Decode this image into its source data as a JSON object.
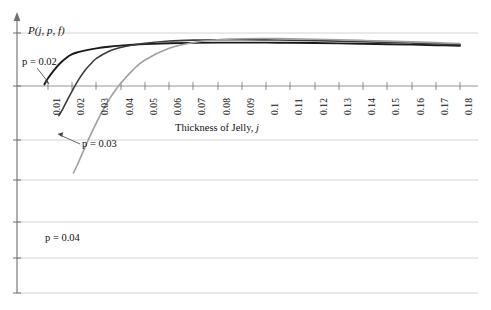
{
  "figure": {
    "name": "probability-vs-jelly-thickness-plot",
    "background": "#ffffff"
  },
  "chart_data": {
    "type": "line",
    "title": "",
    "xlabel": "Thickness of Jelly, j",
    "ylabel": "P(j, p, f)",
    "xlabel_plain": "Thickness of Jelly",
    "xlabel_variable": "j",
    "ylabel_text": "P(j, p, f)",
    "x_tick_labels": [
      "0.01",
      "0.02",
      "0.03",
      "0.04",
      "0.05",
      "0.06",
      "0.07",
      "0.08",
      "0.09",
      "0.1",
      "0.11",
      "0.12",
      "0.13",
      "0.14",
      "0.15",
      "0.16",
      "0.17",
      "0.18"
    ],
    "x_tick_values": [
      0.01,
      0.02,
      0.03,
      0.04,
      0.05,
      0.06,
      0.07,
      0.08,
      0.09,
      0.1,
      0.11,
      0.12,
      0.13,
      0.14,
      0.15,
      0.16,
      0.17,
      0.18
    ],
    "xlim": [
      0.005,
      0.185
    ],
    "y_tick_labels": [],
    "ylim_note": "unlabeled y axis; horizontal gridlines only",
    "grid": "horizontal",
    "grid_color": "#c8c8c8",
    "legend_position": "inline-annotations",
    "axis_color": "#555555",
    "series": [
      {
        "name": "p = 0.02",
        "label": "p = 0.02",
        "color": "#1a1a1a",
        "annotation_text": "p = 0.02",
        "x": [
          0.0085,
          0.01,
          0.0125,
          0.015,
          0.0175,
          0.02,
          0.0225,
          0.025,
          0.03,
          0.035,
          0.04,
          0.045,
          0.05,
          0.06,
          0.07,
          0.08,
          0.09,
          0.1,
          0.11,
          0.12,
          0.13,
          0.14,
          0.15,
          0.16,
          0.17,
          0.18
        ],
        "y": [
          0.03,
          0.145,
          0.3,
          0.43,
          0.53,
          0.6,
          0.64,
          0.668,
          0.71,
          0.74,
          0.762,
          0.778,
          0.79,
          0.806,
          0.814,
          0.818,
          0.819,
          0.818,
          0.815,
          0.81,
          0.804,
          0.797,
          0.789,
          0.78,
          0.77,
          0.76
        ]
      },
      {
        "name": "p = 0.03",
        "label": "p = 0.03",
        "color": "#3c3c3c",
        "annotation_text": "p = 0.03",
        "x": [
          0.0145,
          0.016,
          0.018,
          0.02,
          0.0225,
          0.025,
          0.0275,
          0.03,
          0.035,
          0.04,
          0.045,
          0.05,
          0.06,
          0.07,
          0.08,
          0.09,
          0.1,
          0.11,
          0.12,
          0.13,
          0.14,
          0.15,
          0.16,
          0.17,
          0.18
        ],
        "y": [
          -0.56,
          -0.44,
          -0.26,
          -0.09,
          0.11,
          0.28,
          0.41,
          0.52,
          0.65,
          0.726,
          0.775,
          0.808,
          0.848,
          0.866,
          0.873,
          0.874,
          0.87,
          0.864,
          0.856,
          0.846,
          0.835,
          0.823,
          0.81,
          0.796,
          0.781
        ]
      },
      {
        "name": "p = 0.04",
        "label": "p = 0.04",
        "color": "#a0a0a0",
        "annotation_text": "p = 0.04",
        "x": [
          0.0205,
          0.022,
          0.024,
          0.026,
          0.028,
          0.03,
          0.0325,
          0.035,
          0.0375,
          0.04,
          0.045,
          0.05,
          0.06,
          0.07,
          0.08,
          0.09,
          0.1,
          0.11,
          0.12,
          0.13,
          0.14,
          0.15,
          0.16,
          0.17,
          0.18
        ],
        "y": [
          -1.64,
          -1.5,
          -1.29,
          -1.08,
          -0.88,
          -0.69,
          -0.47,
          -0.27,
          -0.1,
          0.05,
          0.3,
          0.49,
          0.71,
          0.82,
          0.872,
          0.892,
          0.895,
          0.89,
          0.882,
          0.872,
          0.86,
          0.847,
          0.833,
          0.818,
          0.802
        ]
      }
    ],
    "annotations": [
      {
        "text": "p = 0.02",
        "target_series": "p = 0.02",
        "arrow": true
      },
      {
        "text": "p = 0.03",
        "target_series": "p = 0.03",
        "arrow": true
      },
      {
        "text": "p = 0.04",
        "target_series": "p = 0.04",
        "arrow": false
      }
    ]
  }
}
